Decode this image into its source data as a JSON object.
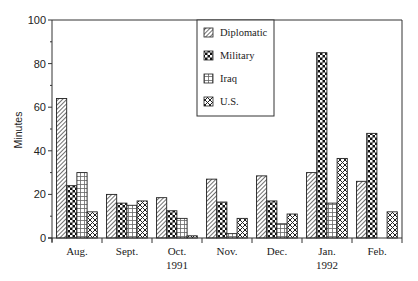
{
  "chart_data": {
    "type": "bar",
    "title": "",
    "xlabel": "",
    "ylabel": "Minutes",
    "ylim": [
      0,
      100
    ],
    "yticks": [
      0,
      20,
      40,
      60,
      80,
      100
    ],
    "grid": false,
    "legend_position": "top-center (inside plot)",
    "categories": [
      "Aug.",
      "Sept.",
      "Oct.",
      "Nov.",
      "Dec.",
      "Jan.",
      "Feb."
    ],
    "year_labels": [
      {
        "label": "1991",
        "under_category": "Oct."
      },
      {
        "label": "1992",
        "under_category": "Jan."
      }
    ],
    "series": [
      {
        "name": "Diplomatic",
        "pattern": "diagonal-hatch",
        "values": [
          64,
          20,
          18.5,
          27,
          28.5,
          30,
          26
        ]
      },
      {
        "name": "Military",
        "pattern": "dark-checker",
        "values": [
          24,
          16,
          12.5,
          16.5,
          17,
          85,
          48
        ]
      },
      {
        "name": "Iraq",
        "pattern": "grid",
        "values": [
          30,
          15,
          9,
          2,
          6.5,
          16,
          0
        ]
      },
      {
        "name": "U.S.",
        "pattern": "crosshatch",
        "values": [
          12,
          17,
          1,
          9,
          11,
          36.5,
          12
        ]
      }
    ]
  }
}
